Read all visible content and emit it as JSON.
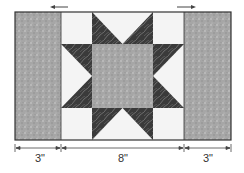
{
  "diagram": {
    "dimensions": [
      {
        "label": "3\"",
        "from": "left-strip-start",
        "to": "left-strip-end"
      },
      {
        "label": "8\"",
        "from": "star-block-start",
        "to": "star-block-end"
      },
      {
        "label": "3\"",
        "from": "right-strip-start",
        "to": "right-strip-end"
      }
    ],
    "arrows": [
      {
        "direction": "left",
        "position": "top-left"
      },
      {
        "direction": "right",
        "position": "top-right"
      }
    ],
    "colors": {
      "border": "#333333",
      "light_fabric": "#f4f4f4",
      "medium_fabric": "#a8a8a8",
      "dark_fabric": "#3a3a3a"
    }
  }
}
